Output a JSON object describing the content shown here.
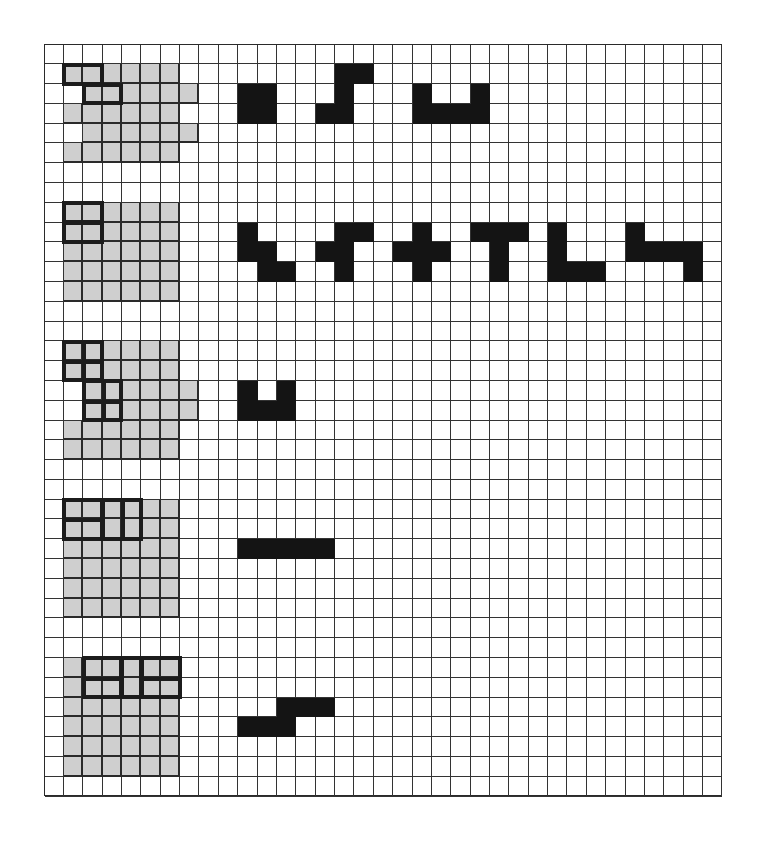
{
  "figure": {
    "grid": {
      "cols": 35,
      "rows": 38,
      "cell_w": 19.37,
      "cell_h": 19.79
    },
    "colors": {
      "gray": "#cfcfcf",
      "black": "#141414",
      "line": "#333333",
      "background": "#ffffff"
    },
    "gray_regions": [
      {
        "name": "region-1",
        "rows": [
          [
            1,
            1,
            6
          ],
          [
            2,
            2,
            7
          ],
          [
            3,
            1,
            6
          ],
          [
            4,
            2,
            7
          ],
          [
            5,
            1,
            6
          ]
        ]
      },
      {
        "name": "region-2",
        "rows": [
          [
            8,
            1,
            6
          ],
          [
            9,
            1,
            6
          ],
          [
            10,
            1,
            6
          ],
          [
            11,
            1,
            6
          ],
          [
            12,
            1,
            6
          ]
        ]
      },
      {
        "name": "region-3",
        "rows": [
          [
            15,
            1,
            6
          ],
          [
            16,
            1,
            6
          ],
          [
            17,
            2,
            7
          ],
          [
            18,
            2,
            7
          ],
          [
            19,
            1,
            6
          ],
          [
            20,
            1,
            6
          ]
        ]
      },
      {
        "name": "region-4",
        "rows": [
          [
            23,
            1,
            6
          ],
          [
            24,
            1,
            6
          ],
          [
            25,
            1,
            6
          ],
          [
            26,
            1,
            6
          ],
          [
            27,
            1,
            6
          ],
          [
            28,
            1,
            6
          ]
        ]
      },
      {
        "name": "region-5",
        "rows": [
          [
            31,
            1,
            6
          ],
          [
            32,
            1,
            6
          ],
          [
            33,
            1,
            6
          ],
          [
            34,
            1,
            6
          ],
          [
            35,
            1,
            6
          ],
          [
            36,
            1,
            6
          ]
        ]
      }
    ],
    "outlines": [
      {
        "r": 1,
        "c": 1,
        "h": 1,
        "w": 2,
        "v_div": [],
        "h_div": []
      },
      {
        "r": 2,
        "c": 2,
        "h": 1,
        "w": 2,
        "v_div": [],
        "h_div": []
      },
      {
        "r": 8,
        "c": 1,
        "h": 1,
        "w": 2,
        "v_div": [],
        "h_div": []
      },
      {
        "r": 9,
        "c": 1,
        "h": 1,
        "w": 2,
        "v_div": [],
        "h_div": []
      },
      {
        "r": 15,
        "c": 1,
        "h": 2,
        "w": 2,
        "v_div": [
          1
        ],
        "h_div": [
          1
        ]
      },
      {
        "r": 17,
        "c": 2,
        "h": 2,
        "w": 2,
        "v_div": [
          1
        ],
        "h_div": [
          1
        ]
      },
      {
        "r": 23,
        "c": 1,
        "h": 2,
        "w": 2,
        "v_div": [],
        "h_div": [
          1
        ]
      },
      {
        "r": 23,
        "c": 3,
        "h": 2,
        "w": 2,
        "v_div": [
          1
        ],
        "h_div": []
      },
      {
        "r": 31,
        "c": 2,
        "h": 2,
        "w": 2,
        "v_div": [],
        "h_div": [
          1
        ]
      },
      {
        "r": 31,
        "c": 4,
        "h": 2,
        "w": 1,
        "v_div": [],
        "h_div": []
      },
      {
        "r": 31,
        "c": 5,
        "h": 2,
        "w": 2,
        "v_div": [],
        "h_div": [
          1
        ]
      }
    ],
    "shapes": [
      {
        "name": "square-tetromino",
        "cells": [
          [
            2,
            10
          ],
          [
            2,
            11
          ],
          [
            3,
            10
          ],
          [
            3,
            11
          ]
        ]
      },
      {
        "name": "s-pentomino",
        "cells": [
          [
            1,
            15
          ],
          [
            1,
            16
          ],
          [
            2,
            15
          ],
          [
            3,
            14
          ],
          [
            3,
            15
          ]
        ]
      },
      {
        "name": "u-hexomino",
        "cells": [
          [
            2,
            19
          ],
          [
            2,
            22
          ],
          [
            3,
            19
          ],
          [
            3,
            20
          ],
          [
            3,
            21
          ],
          [
            3,
            22
          ]
        ]
      },
      {
        "name": "w-pentomino",
        "cells": [
          [
            9,
            10
          ],
          [
            10,
            10
          ],
          [
            10,
            11
          ],
          [
            11,
            11
          ],
          [
            11,
            12
          ]
        ]
      },
      {
        "name": "f-pentomino",
        "cells": [
          [
            9,
            15
          ],
          [
            9,
            16
          ],
          [
            10,
            14
          ],
          [
            10,
            15
          ],
          [
            11,
            15
          ]
        ]
      },
      {
        "name": "x-pentomino",
        "cells": [
          [
            9,
            19
          ],
          [
            10,
            18
          ],
          [
            10,
            19
          ],
          [
            10,
            20
          ],
          [
            11,
            19
          ]
        ]
      },
      {
        "name": "t-pentomino",
        "cells": [
          [
            9,
            22
          ],
          [
            9,
            23
          ],
          [
            9,
            24
          ],
          [
            10,
            23
          ],
          [
            11,
            23
          ]
        ]
      },
      {
        "name": "v-pentomino",
        "cells": [
          [
            9,
            26
          ],
          [
            10,
            26
          ],
          [
            11,
            26
          ],
          [
            11,
            27
          ],
          [
            11,
            28
          ]
        ]
      },
      {
        "name": "s-hexomino",
        "cells": [
          [
            9,
            30
          ],
          [
            10,
            30
          ],
          [
            10,
            31
          ],
          [
            10,
            32
          ],
          [
            10,
            33
          ],
          [
            11,
            33
          ]
        ]
      },
      {
        "name": "u-pentomino",
        "cells": [
          [
            17,
            10
          ],
          [
            17,
            12
          ],
          [
            18,
            10
          ],
          [
            18,
            11
          ],
          [
            18,
            12
          ]
        ]
      },
      {
        "name": "i-pentomino",
        "cells": [
          [
            25,
            10
          ],
          [
            25,
            11
          ],
          [
            25,
            12
          ],
          [
            25,
            13
          ],
          [
            25,
            14
          ]
        ]
      },
      {
        "name": "n-hexomino",
        "cells": [
          [
            33,
            12
          ],
          [
            33,
            13
          ],
          [
            33,
            14
          ],
          [
            34,
            10
          ],
          [
            34,
            11
          ],
          [
            34,
            12
          ]
        ]
      }
    ]
  }
}
